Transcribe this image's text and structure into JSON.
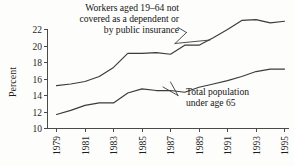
{
  "chart_data": {
    "type": "line",
    "title": "",
    "subtitle": "",
    "xlabel": "",
    "ylabel": "Percent",
    "ylim": [
      10,
      23
    ],
    "xlim": [
      1979,
      1995
    ],
    "grid": false,
    "legend_position": "none",
    "ytick_labels": [
      "22",
      "20",
      "18",
      "16",
      "14",
      "12",
      "10"
    ],
    "yticks": [
      22,
      20,
      18,
      16,
      14,
      12,
      10
    ],
    "xtick_labels": [
      "1979",
      "1981",
      "1983",
      "1985",
      "1987",
      "1989",
      "1991",
      "1993",
      "1995"
    ],
    "xticks": [
      1979,
      1981,
      1983,
      1985,
      1987,
      1989,
      1991,
      1993,
      1995
    ],
    "x": [
      1979,
      1980,
      1981,
      1982,
      1983,
      1984,
      1985,
      1986,
      1987,
      1988,
      1989,
      1990,
      1991,
      1992,
      1993,
      1994,
      1995
    ],
    "series": [
      {
        "name": "Workers aged 19-64 not covered as a dependent or by public insurance",
        "values": [
          15.2,
          15.4,
          15.7,
          16.3,
          17.4,
          19.1,
          19.1,
          19.2,
          19.0,
          20.1,
          20.1,
          21.0,
          22.0,
          23.1,
          23.2,
          22.8,
          23.0
        ]
      },
      {
        "name": "Total population under age 65",
        "values": [
          11.7,
          12.2,
          12.8,
          13.1,
          13.1,
          14.3,
          14.8,
          14.6,
          14.6,
          14.4,
          15.0,
          15.4,
          15.8,
          16.3,
          16.9,
          17.2,
          17.2
        ]
      }
    ],
    "annotations": [
      {
        "id": "workers-annotation",
        "lines": [
          "Workers aged 19–64 not",
          "covered as a dependent or",
          "by public insurance"
        ],
        "align": "right"
      },
      {
        "id": "total-population-annotation",
        "lines": [
          "Total population",
          "under age 65"
        ],
        "align": "left"
      }
    ],
    "colors": {
      "line": "#3b3b3b",
      "axis": "#4a4a4a",
      "text": "#1a1a1a",
      "background": "#fdfdfc"
    }
  }
}
